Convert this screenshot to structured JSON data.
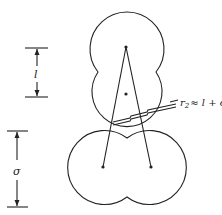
{
  "diagram": {
    "labels": {
      "l_dimension": "l",
      "sigma_dimension": "σ",
      "r2_prefix": "r",
      "r2_subscript": "2",
      "r2_expression": "≈ l + σ"
    },
    "colors": {
      "stroke": "#222222",
      "background": "#ffffff"
    }
  }
}
